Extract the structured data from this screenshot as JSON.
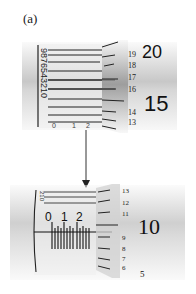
{
  "figure": {
    "label": "(a)",
    "top_micrometer": {
      "sleeve_digits_rotated": [
        "9",
        "8",
        "7",
        "6",
        "5",
        "4",
        "3",
        "2",
        "1",
        "0"
      ],
      "sleeve_bottom_digits": [
        "0",
        "1",
        "2"
      ],
      "thimble_numbers": [
        "19",
        "18",
        "17",
        "16",
        "14",
        "13"
      ],
      "thimble_large_numbers": [
        "20",
        "15"
      ]
    },
    "bottom_micrometer": {
      "sleeve_digits": [
        "0",
        "1",
        "2"
      ],
      "sleeve_rotated_digits": [
        "2",
        "1",
        "0"
      ],
      "thimble_numbers": [
        "13",
        "12",
        "11",
        "9",
        "8",
        "7",
        "6"
      ],
      "thimble_large_numbers": [
        "10",
        "5"
      ]
    }
  }
}
